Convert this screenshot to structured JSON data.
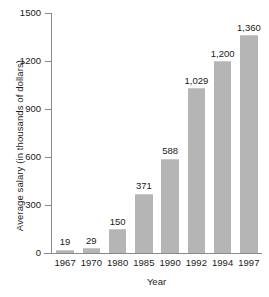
{
  "chart_data": {
    "type": "bar",
    "title": "",
    "xlabel": "Year",
    "ylabel": "Average salary (in thousands of dollars)",
    "categories": [
      "1967",
      "1970",
      "1980",
      "1985",
      "1990",
      "1992",
      "1994",
      "1997"
    ],
    "values": [
      19,
      29,
      150,
      371,
      588,
      1029,
      1200,
      1360
    ],
    "value_labels": [
      "19",
      "29",
      "150",
      "371",
      "588",
      "1,029",
      "1,200",
      "1,360"
    ],
    "ylim": [
      0,
      1500
    ],
    "yticks": [
      0,
      300,
      600,
      900,
      1200,
      1500
    ],
    "ytick_labels": [
      "0",
      "300",
      "600",
      "900",
      "1200",
      "1500"
    ],
    "grid": false,
    "legend": "none",
    "bar_color": "#b5b5b5",
    "axis_color": "#8a8a8a",
    "text_color": "#1a1a1a"
  }
}
